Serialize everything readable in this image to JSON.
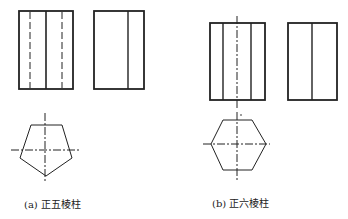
{
  "figures": [
    {
      "id": "a",
      "caption": "(a) 正五棱柱",
      "shape": "pentagonal-prism"
    },
    {
      "id": "b",
      "caption": "(b) 正六棱柱",
      "shape": "hexagonal-prism"
    }
  ],
  "colors": {
    "line": "#222222",
    "background": "#ffffff"
  }
}
